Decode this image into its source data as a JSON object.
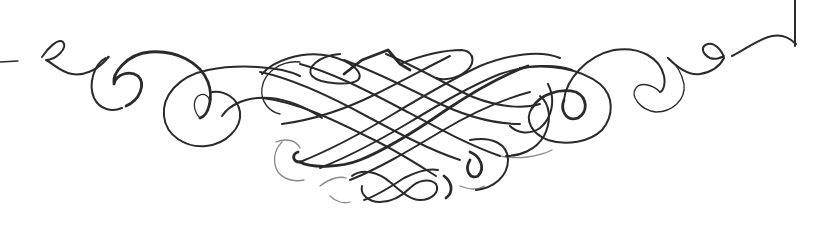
{
  "image": {
    "type": "calligraphic-flourish-ornament",
    "background": "#ffffff",
    "stroke_color": "#2a2a2a",
    "width": 832,
    "height": 227
  },
  "ornament": {
    "parts": [
      {
        "name": "left-pen-tail",
        "description": "thick pen nib stub at far left"
      },
      {
        "name": "left-scrolls",
        "description": "spiral curls on left side"
      },
      {
        "name": "center-lattice",
        "description": "interwoven diagonal lattice with peaked top"
      },
      {
        "name": "bottom-loops",
        "description": "small knotted loops beneath center"
      },
      {
        "name": "right-scrolls",
        "description": "spiral curls on right side"
      },
      {
        "name": "right-corner-bracket",
        "description": "vertical line at top right ending in a wave"
      }
    ]
  }
}
